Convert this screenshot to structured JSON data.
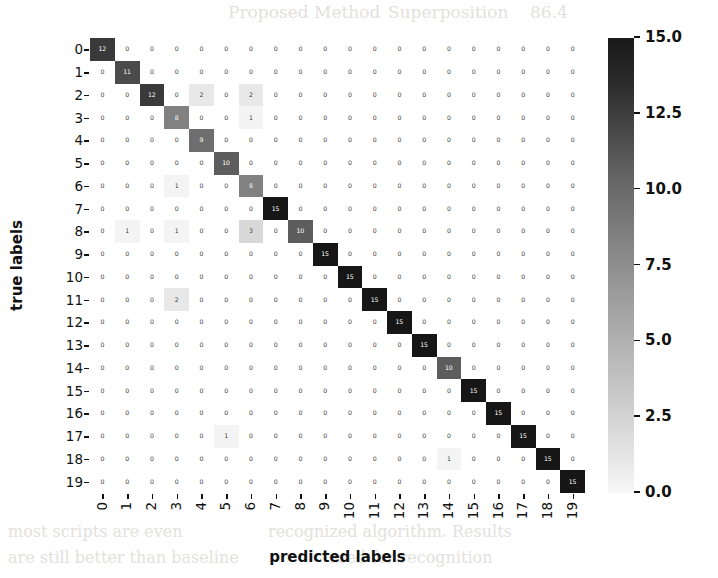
{
  "figure": {
    "type": "confusion-matrix-heatmap"
  },
  "chart_data": {
    "type": "heatmap",
    "title": "",
    "xlabel": "predicted labels",
    "ylabel": "true labels",
    "grid": false,
    "legend_position": "right",
    "colormap": "Greys",
    "colorbar": {
      "min": 0.0,
      "max": 15.0,
      "ticks": [
        "15.0",
        "12.5",
        "10.0",
        "7.5",
        "5.0",
        "2.5",
        "0.0"
      ],
      "tick_values": [
        15.0,
        12.5,
        10.0,
        7.5,
        5.0,
        2.5,
        0.0
      ],
      "low_color": "#f7f7f7",
      "high_color": "#1a1a1a"
    },
    "x_categories": [
      "0",
      "1",
      "2",
      "3",
      "4",
      "5",
      "6",
      "7",
      "8",
      "9",
      "10",
      "11",
      "12",
      "13",
      "14",
      "15",
      "16",
      "17",
      "18",
      "19"
    ],
    "y_categories": [
      "0",
      "1",
      "2",
      "3",
      "4",
      "5",
      "6",
      "7",
      "8",
      "9",
      "10",
      "11",
      "12",
      "13",
      "14",
      "15",
      "16",
      "17",
      "18",
      "19"
    ],
    "zlim": [
      0,
      15
    ],
    "values": [
      [
        12,
        0,
        0,
        0,
        0,
        0,
        0,
        0,
        0,
        0,
        0,
        0,
        0,
        0,
        0,
        0,
        0,
        0,
        0,
        0
      ],
      [
        0,
        11,
        0,
        0,
        0,
        0,
        0,
        0,
        0,
        0,
        0,
        0,
        0,
        0,
        0,
        0,
        0,
        0,
        0,
        0
      ],
      [
        0,
        0,
        12,
        0,
        2,
        0,
        2,
        0,
        0,
        0,
        0,
        0,
        0,
        0,
        0,
        0,
        0,
        0,
        0,
        0
      ],
      [
        0,
        0,
        0,
        8,
        0,
        0,
        1,
        0,
        0,
        0,
        0,
        0,
        0,
        0,
        0,
        0,
        0,
        0,
        0,
        0
      ],
      [
        0,
        0,
        0,
        0,
        9,
        0,
        0,
        0,
        0,
        0,
        0,
        0,
        0,
        0,
        0,
        0,
        0,
        0,
        0,
        0
      ],
      [
        0,
        0,
        0,
        0,
        0,
        10,
        0,
        0,
        0,
        0,
        0,
        0,
        0,
        0,
        0,
        0,
        0,
        0,
        0,
        0
      ],
      [
        0,
        0,
        0,
        1,
        0,
        0,
        8,
        0,
        0,
        0,
        0,
        0,
        0,
        0,
        0,
        0,
        0,
        0,
        0,
        0
      ],
      [
        0,
        0,
        0,
        0,
        0,
        0,
        0,
        15,
        0,
        0,
        0,
        0,
        0,
        0,
        0,
        0,
        0,
        0,
        0,
        0
      ],
      [
        0,
        1,
        0,
        1,
        0,
        0,
        3,
        0,
        10,
        0,
        0,
        0,
        0,
        0,
        0,
        0,
        0,
        0,
        0,
        0
      ],
      [
        0,
        0,
        0,
        0,
        0,
        0,
        0,
        0,
        0,
        15,
        0,
        0,
        0,
        0,
        0,
        0,
        0,
        0,
        0,
        0
      ],
      [
        0,
        0,
        0,
        0,
        0,
        0,
        0,
        0,
        0,
        0,
        15,
        0,
        0,
        0,
        0,
        0,
        0,
        0,
        0,
        0
      ],
      [
        0,
        0,
        0,
        2,
        0,
        0,
        0,
        0,
        0,
        0,
        0,
        15,
        0,
        0,
        0,
        0,
        0,
        0,
        0,
        0
      ],
      [
        0,
        0,
        0,
        0,
        0,
        0,
        0,
        0,
        0,
        0,
        0,
        0,
        15,
        0,
        0,
        0,
        0,
        0,
        0,
        0
      ],
      [
        0,
        0,
        0,
        0,
        0,
        0,
        0,
        0,
        0,
        0,
        0,
        0,
        0,
        15,
        0,
        0,
        0,
        0,
        0,
        0
      ],
      [
        0,
        0,
        0,
        0,
        0,
        0,
        0,
        0,
        0,
        0,
        0,
        0,
        0,
        0,
        10,
        0,
        0,
        0,
        0,
        0
      ],
      [
        0,
        0,
        0,
        0,
        0,
        0,
        0,
        0,
        0,
        0,
        0,
        0,
        0,
        0,
        0,
        15,
        0,
        0,
        0,
        0
      ],
      [
        0,
        0,
        0,
        0,
        0,
        0,
        0,
        0,
        0,
        0,
        0,
        0,
        0,
        0,
        0,
        0,
        15,
        0,
        0,
        0
      ],
      [
        0,
        0,
        0,
        0,
        0,
        1,
        0,
        0,
        0,
        0,
        0,
        0,
        0,
        0,
        0,
        0,
        0,
        15,
        0,
        0
      ],
      [
        0,
        0,
        0,
        0,
        0,
        0,
        0,
        0,
        0,
        0,
        0,
        0,
        0,
        0,
        1,
        0,
        0,
        0,
        15,
        0
      ],
      [
        0,
        0,
        0,
        0,
        0,
        0,
        0,
        0,
        0,
        0,
        0,
        0,
        0,
        0,
        0,
        0,
        0,
        0,
        0,
        15
      ]
    ]
  },
  "bleed_text": [
    {
      "text": "Proposed Method",
      "x": 228,
      "y": 2,
      "size": 17
    },
    {
      "text": "Superposition",
      "x": 388,
      "y": 2,
      "size": 17
    },
    {
      "text": "86.4",
      "x": 530,
      "y": 2,
      "size": 17
    },
    {
      "text": "Illustrates",
      "x": 218,
      "y": 140,
      "size": 15
    },
    {
      "text": "performance",
      "x": 218,
      "y": 170,
      "size": 15
    },
    {
      "text": "the proposed",
      "x": 218,
      "y": 200,
      "size": 15
    },
    {
      "text": "confusion matrix",
      "x": 218,
      "y": 232,
      "size": 15
    },
    {
      "text": "classification",
      "x": 218,
      "y": 262,
      "size": 15
    },
    {
      "text": "results in the",
      "x": 218,
      "y": 292,
      "size": 15
    },
    {
      "text": "test set of",
      "x": 218,
      "y": 322,
      "size": 15
    },
    {
      "text": "this collection",
      "x": 218,
      "y": 352,
      "size": 15
    },
    {
      "text": "the proposed",
      "x": 218,
      "y": 382,
      "size": 15
    },
    {
      "text": "classifier",
      "x": 218,
      "y": 412,
      "size": 15
    },
    {
      "text": "achieves",
      "x": 218,
      "y": 442,
      "size": 15
    },
    {
      "text": "most scripts are even",
      "x": 8,
      "y": 522,
      "size": 16
    },
    {
      "text": "recognized algorithm. Results",
      "x": 268,
      "y": 522,
      "size": 16
    },
    {
      "text": "are still better than baseline",
      "x": 8,
      "y": 548,
      "size": 16
    },
    {
      "text": "used for recognition",
      "x": 328,
      "y": 548,
      "size": 16
    }
  ]
}
